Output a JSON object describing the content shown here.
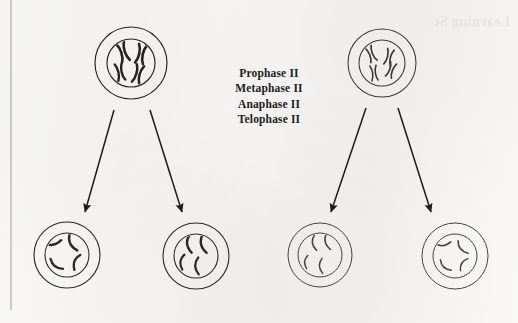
{
  "figure": {
    "background_color": "#f6f5f3",
    "ink_color": "#1d1c1a",
    "margin_rule_color": "#8e8d8b"
  },
  "phase_labels": {
    "line1": "Prophase II",
    "line2": "Metaphase II",
    "line3": "Anaphase II",
    "line4": "Telophase II"
  },
  "bleed_through": {
    "text": "Learning Sc"
  },
  "margin_rule": {
    "x": 11,
    "y_top": 0,
    "y_bottom": 310
  },
  "chart_data": {
    "type": "diagram",
    "stages": [
      "Prophase II",
      "Metaphase II",
      "Anaphase II",
      "Telophase II"
    ],
    "parent_cell_count": 2,
    "daughter_cell_count": 4,
    "chromosomes_per_parent_cell": 4,
    "chromosomes_per_daughter_cell": 4,
    "chromosome_form_parent": "duplicated sister chromatids (X-shaped)",
    "chromosome_form_daughter": "single chromatid (curved rod)",
    "arrow_count": 4
  },
  "cells": [
    {
      "name": "parent-cell-left",
      "role": "parent",
      "cx": 131,
      "cy": 63,
      "outer_r": 36,
      "inner_r": 24,
      "stroke_width": 1.15,
      "ink": "#25231f",
      "chromosome_style": "x-shaped-thick",
      "chromosome_count": 4,
      "chromosomes": [
        {
          "cx": 123,
          "cy": 52,
          "angle": -18,
          "len": 19,
          "w": 2.6
        },
        {
          "cx": 141,
          "cy": 54,
          "angle": 12,
          "len": 19,
          "w": 2.6
        },
        {
          "cx": 120,
          "cy": 72,
          "angle": -12,
          "len": 17,
          "w": 2.4
        },
        {
          "cx": 138,
          "cy": 74,
          "angle": 16,
          "len": 18,
          "w": 2.5
        }
      ]
    },
    {
      "name": "parent-cell-right",
      "role": "parent",
      "cx": 382,
      "cy": 63,
      "outer_r": 34,
      "inner_r": 23,
      "stroke_width": 1.05,
      "ink": "#3a3834",
      "chromosome_style": "x-shaped-thin",
      "chromosome_count": 4,
      "chromosomes": [
        {
          "cx": 371,
          "cy": 54,
          "angle": -22,
          "len": 16,
          "w": 1.7
        },
        {
          "cx": 389,
          "cy": 57,
          "angle": 14,
          "len": 16,
          "w": 1.7
        },
        {
          "cx": 374,
          "cy": 73,
          "angle": -8,
          "len": 15,
          "w": 1.6
        },
        {
          "cx": 391,
          "cy": 70,
          "angle": 20,
          "len": 15,
          "w": 1.7
        }
      ]
    },
    {
      "name": "daughter-cell-1",
      "role": "daughter",
      "cx": 67,
      "cy": 255,
      "outer_r": 33,
      "inner_r": 22,
      "stroke_width": 1.1,
      "ink": "#2b2926",
      "chromosome_style": "single-thick",
      "chromosome_count": 4,
      "chromosomes": [
        {
          "x": 53,
          "y": 243,
          "rot": -12,
          "len": 17,
          "w": 2.5
        },
        {
          "x": 72,
          "y": 243,
          "rot": 62,
          "len": 18,
          "w": 2.5
        },
        {
          "x": 56,
          "y": 265,
          "rot": 35,
          "len": 16,
          "w": 2.3
        },
        {
          "x": 76,
          "y": 262,
          "rot": 108,
          "len": 16,
          "w": 2.3
        }
      ]
    },
    {
      "name": "daughter-cell-2",
      "role": "daughter",
      "cx": 196,
      "cy": 256,
      "outer_r": 33,
      "inner_r": 22,
      "stroke_width": 1.1,
      "ink": "#2b2926",
      "chromosome_style": "single-thick",
      "chromosome_count": 4,
      "chromosomes": [
        {
          "x": 189,
          "y": 244,
          "rot": 80,
          "len": 18,
          "w": 2.4
        },
        {
          "x": 203,
          "y": 244,
          "rot": 75,
          "len": 19,
          "w": 2.4
        },
        {
          "x": 182,
          "y": 262,
          "rot": 95,
          "len": 15,
          "w": 2.2
        },
        {
          "x": 197,
          "y": 266,
          "rot": 85,
          "len": 17,
          "w": 2.3
        }
      ]
    },
    {
      "name": "daughter-cell-3",
      "role": "daughter",
      "cx": 320,
      "cy": 255,
      "outer_r": 32,
      "inner_r": 22,
      "stroke_width": 1.0,
      "ink": "#45423e",
      "chromosome_style": "single-thin",
      "chromosome_count": 4,
      "chromosomes": [
        {
          "x": 314,
          "y": 243,
          "rot": 78,
          "len": 15,
          "w": 1.6
        },
        {
          "x": 327,
          "y": 242,
          "rot": 72,
          "len": 16,
          "w": 1.6
        },
        {
          "x": 306,
          "y": 262,
          "rot": 92,
          "len": 13,
          "w": 1.5
        },
        {
          "x": 321,
          "y": 266,
          "rot": 84,
          "len": 15,
          "w": 1.5
        }
      ]
    },
    {
      "name": "daughter-cell-4",
      "role": "daughter",
      "cx": 455,
      "cy": 256,
      "outer_r": 33,
      "inner_r": 22,
      "stroke_width": 1.0,
      "ink": "#45423e",
      "chromosome_style": "single-thin",
      "chromosome_count": 4,
      "chromosomes": [
        {
          "x": 443,
          "y": 244,
          "rot": -8,
          "len": 16,
          "w": 1.6
        },
        {
          "x": 462,
          "y": 248,
          "rot": 48,
          "len": 16,
          "w": 1.6
        },
        {
          "x": 445,
          "y": 266,
          "rot": 40,
          "len": 15,
          "w": 1.5
        },
        {
          "x": 463,
          "y": 264,
          "rot": 118,
          "len": 14,
          "w": 1.5
        }
      ]
    }
  ],
  "arrows": [
    {
      "name": "arrow-parent-left-to-daughter-1",
      "x1": 114,
      "y1": 110,
      "x2": 85,
      "y2": 212
    },
    {
      "name": "arrow-parent-left-to-daughter-2",
      "x1": 150,
      "y1": 110,
      "x2": 182,
      "y2": 212
    },
    {
      "name": "arrow-parent-right-to-daughter-3",
      "x1": 366,
      "y1": 108,
      "x2": 331,
      "y2": 212
    },
    {
      "name": "arrow-parent-right-to-daughter-4",
      "x1": 398,
      "y1": 108,
      "x2": 431,
      "y2": 212
    }
  ]
}
